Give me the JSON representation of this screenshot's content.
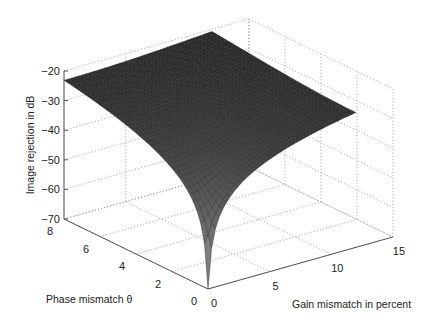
{
  "chart_data": {
    "type": "surface",
    "title": "",
    "xlabel": "Gain mismatch in percent",
    "ylabel": "Phase mismatch θ",
    "zlabel": "Image rejection in dB",
    "x_ticks": [
      "0",
      "5",
      "10",
      "15"
    ],
    "y_ticks": [
      "0",
      "2",
      "4",
      "6",
      "8"
    ],
    "z_ticks": [
      "-20",
      "-30",
      "-40",
      "-50",
      "-60",
      "-70"
    ],
    "xlim": [
      0,
      15
    ],
    "ylim": [
      0,
      8
    ],
    "zlim": [
      -70,
      -20
    ],
    "grid": true,
    "surface_x_range": [
      0,
      12
    ],
    "surface_y_range": [
      0,
      8
    ],
    "surface_corner_values": [
      {
        "gain": 0,
        "phase": 0,
        "image_rejection_db": -70
      },
      {
        "gain": 0,
        "phase": 8,
        "image_rejection_db": -23
      },
      {
        "gain": 12,
        "phase": 0,
        "image_rejection_db": -24.5
      },
      {
        "gain": 12,
        "phase": 8,
        "image_rejection_db": -21
      }
    ],
    "colormap": "gray"
  }
}
